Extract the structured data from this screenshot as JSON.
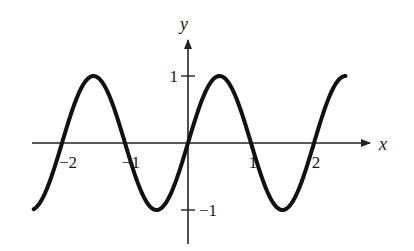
{
  "chart_data": {
    "type": "line",
    "title": "",
    "xlabel": "x",
    "ylabel": "y",
    "function": "y = sin(pi x)",
    "xlim": [
      -2.45,
      2.5
    ],
    "ylim": [
      -1,
      1
    ],
    "grid": false,
    "legend": null,
    "x_ticks": [
      -2,
      -1,
      1,
      2
    ],
    "x_tick_labels": [
      "−2",
      "−1",
      "1",
      "2"
    ],
    "y_ticks": [
      1,
      -1
    ],
    "y_tick_labels": [
      "1",
      "−1"
    ],
    "series": [
      {
        "name": "sin(pi x)",
        "x": [
          -2.45,
          -2.0,
          -1.5,
          -1.0,
          -0.5,
          0.0,
          0.5,
          1.0,
          1.5,
          2.0,
          2.5
        ],
        "values": [
          -0.99,
          0.0,
          1.0,
          0.0,
          -1.0,
          0.0,
          1.0,
          0.0,
          -1.0,
          0.0,
          1.0
        ]
      }
    ],
    "colors": {
      "curve": "#111111",
      "axes": "#222222"
    }
  }
}
